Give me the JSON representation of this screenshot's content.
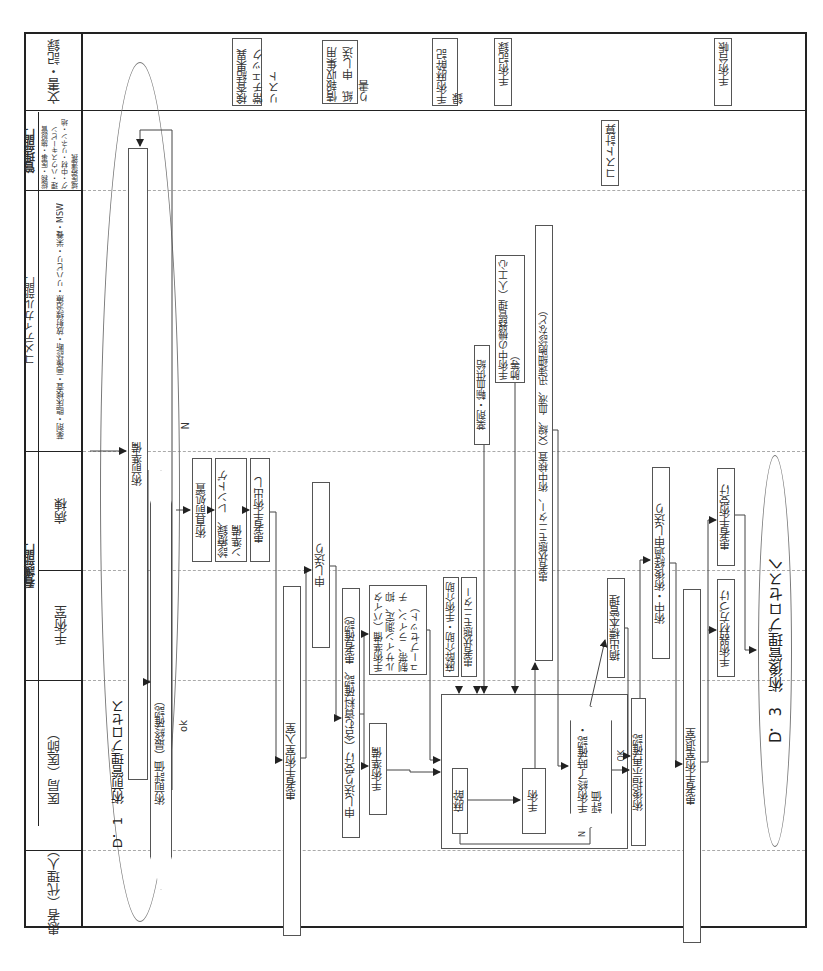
{
  "lanes": {
    "documents": "文書・記録",
    "management_dept": "管理部門",
    "management_sub": "総務・医事・施設管理・ハウスキーピング・中材・リネン・地域医療連携",
    "comedical_dept": "コメディカル部門",
    "comedical_sub": "薬剤・臨床検査・画像診断・放射線治療・リハビリ・栄養・MSW",
    "nursing_dept": "看護部門",
    "ward": "病棟",
    "or_room": "手術室",
    "medical_office": "医局（医師）",
    "patient": "患者（代理人）"
  },
  "processes": {
    "start": "D．1　術前管理プロセス",
    "end": "D．3　術後管理プロセスへ"
  },
  "documents": [
    "検査結果異常チェックリスト",
    "情報収集用紙　申し送り書",
    "手術麻酔記録",
    "手術記録",
    "手術台帳"
  ],
  "management_tasks": [
    "コスト計算"
  ],
  "steps": {
    "pre_op_prep": "術前準備",
    "pre_op_eval": "術前評価（最終確認）",
    "pre_op_treatment": "術直前処置",
    "chart_xray": "診療録、レントゲン準備",
    "patient_departure": "患者手術出し",
    "handover": "申し送り",
    "patient_or_entry": "患者手術室入室",
    "handover_receive": "申し送り受け（含む資料確認、患者確認）",
    "surgery_prep_detail": "手術準備（バイタルサイン測定、抑制帯、ライン、チューブセット）",
    "surgery_prep": "手術準備",
    "anesthesia_assist": "麻酔介助・手術介助",
    "patient_monitor": "患者状態モニター",
    "anesthesia": "麻酔",
    "surgery": "手術",
    "drug_blood": "薬剤・輸血供給",
    "equipment_mgmt": "手術中の機器管理（人工心肺等）",
    "patient_monitor_tests": "患者状態モニター、術中検査（X線、血液、迅速細胞診など）",
    "end_confirm": "手術終了時確認・評価",
    "specimen_mgmt": "摘出標本管理",
    "post_op_instructions": "術後指示再確認",
    "handover_progress": "術中・術後経過申し送り",
    "patient_exit": "患者手術室退室",
    "instrument_cleanup": "手術器材方づけ",
    "patient_receive": "患者手術受け"
  },
  "decision_labels": {
    "yes": "ok",
    "no": "N",
    "ok_caps": "OK"
  }
}
